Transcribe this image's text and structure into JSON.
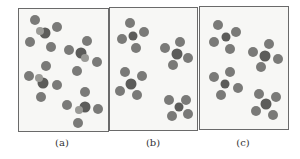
{
  "figure": {
    "panels": [
      {
        "id": "a",
        "label": "(a)",
        "description": "random arrangement of molecules (disordered)"
      },
      {
        "id": "b",
        "label": "(b)",
        "description": "molecules grouped in four clusters of five"
      },
      {
        "id": "c",
        "label": "(c)",
        "description": "molecules grouped in four clusters of five, alternate orientation"
      }
    ]
  },
  "colors": {
    "outer_atom": "#7a7a78",
    "center_atom": "#5c5c5a",
    "panel_bg": "#f7f7f5",
    "border": "#6a6a6a"
  }
}
